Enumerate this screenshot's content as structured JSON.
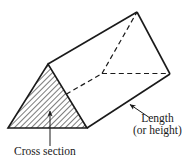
{
  "figure": {
    "type": "triangular-prism-diagram",
    "shape_name": "triangular prism",
    "stroke_color": "#1a1a1a",
    "hatch_color": "#555555",
    "background": "#ffffff"
  },
  "labels": {
    "length": {
      "line1": "Length",
      "line2": "(or height)"
    },
    "cross_section": "Cross section"
  },
  "annotations": {
    "length_arrow": "arrow pointing up-left to the lower-right lateral edge of the prism",
    "cross_section_arrow": "arrow pointing up into the hatched triangular end face"
  }
}
